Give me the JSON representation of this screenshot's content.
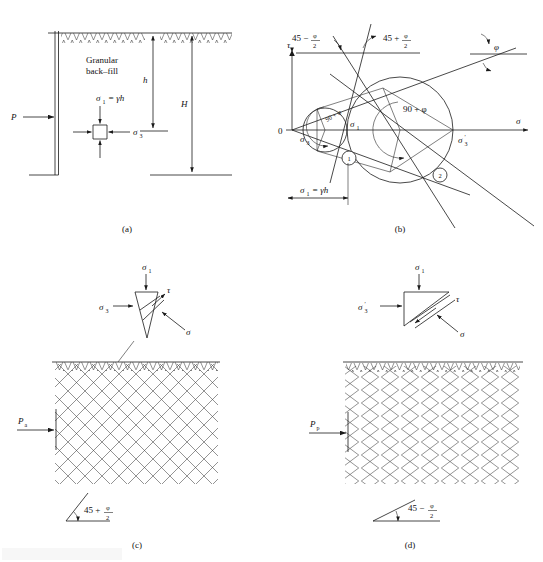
{
  "figure": {
    "domain": "technical-diagram",
    "topic": "Rankine active and passive earth pressure states",
    "panels": [
      {
        "id": "a",
        "caption": "(a)",
        "title": "Retaining wall with granular back-fill"
      },
      {
        "id": "b",
        "caption": "(b)",
        "title": "Mohr circle diagram for active and passive states"
      },
      {
        "id": "c",
        "caption": "(c)",
        "title": "Active failure wedge pattern"
      },
      {
        "id": "d",
        "caption": "(d)",
        "title": "Passive failure wedge pattern"
      }
    ]
  },
  "panel_a": {
    "caption": "(a)",
    "backfill_label_line1": "Granular",
    "backfill_label_line2": "back–fill",
    "force_label": "P",
    "sigma1_label": "σ",
    "sigma1_sub": "1",
    "sigma1_eq": "= γh",
    "sigma3_label": "σ",
    "sigma3_sub": "3",
    "depth_h": "h",
    "depth_H": "H"
  },
  "panel_b": {
    "caption": "(b)",
    "axis_tau": "τ",
    "axis_sigma": "σ",
    "origin": "0",
    "angle_left": "45 −",
    "angle_left_num": "φ",
    "angle_left_den": "2",
    "angle_right": "45 +",
    "angle_right_num": "φ",
    "angle_right_den": "2",
    "phi_label": "φ",
    "angle_inner_small": "90 + φ",
    "angle_inner_large": "90 + φ",
    "sigma3_label": "σ",
    "sigma3_sub": "3",
    "sigma1_label": "σ",
    "sigma1_sub": "1",
    "sigma3p_label": "σ",
    "sigma3p_sub": "3",
    "sigma3p_prime": "′",
    "dim_label": "σ",
    "dim_sub": "1",
    "dim_eq": "= γh",
    "circle1_id": "1",
    "circle2_id": "2"
  },
  "panel_c": {
    "caption": "(c)",
    "sigma1_label": "σ",
    "sigma1_sub": "1",
    "sigma3_label": "σ",
    "sigma3_sub": "3",
    "tau_label": "τ",
    "sigma_label": "σ",
    "pressure_label": "P",
    "pressure_sub": "a",
    "angle_text": "45 +",
    "angle_num": "φ",
    "angle_den": "2"
  },
  "panel_d": {
    "caption": "(d)",
    "sigma1_label": "σ",
    "sigma1_sub": "1",
    "sigma3p_label": "σ",
    "sigma3p_sub": "3",
    "sigma3p_prime": "′",
    "tau_label": "τ",
    "sigma_label": "σ",
    "pressure_label": "P",
    "pressure_sub": "p",
    "angle_text": "45 −",
    "angle_num": "φ",
    "angle_den": "2"
  },
  "colors": {
    "ink": "#1a1a1a",
    "paper": "#ffffff",
    "hatch": "#3a3a3a"
  }
}
